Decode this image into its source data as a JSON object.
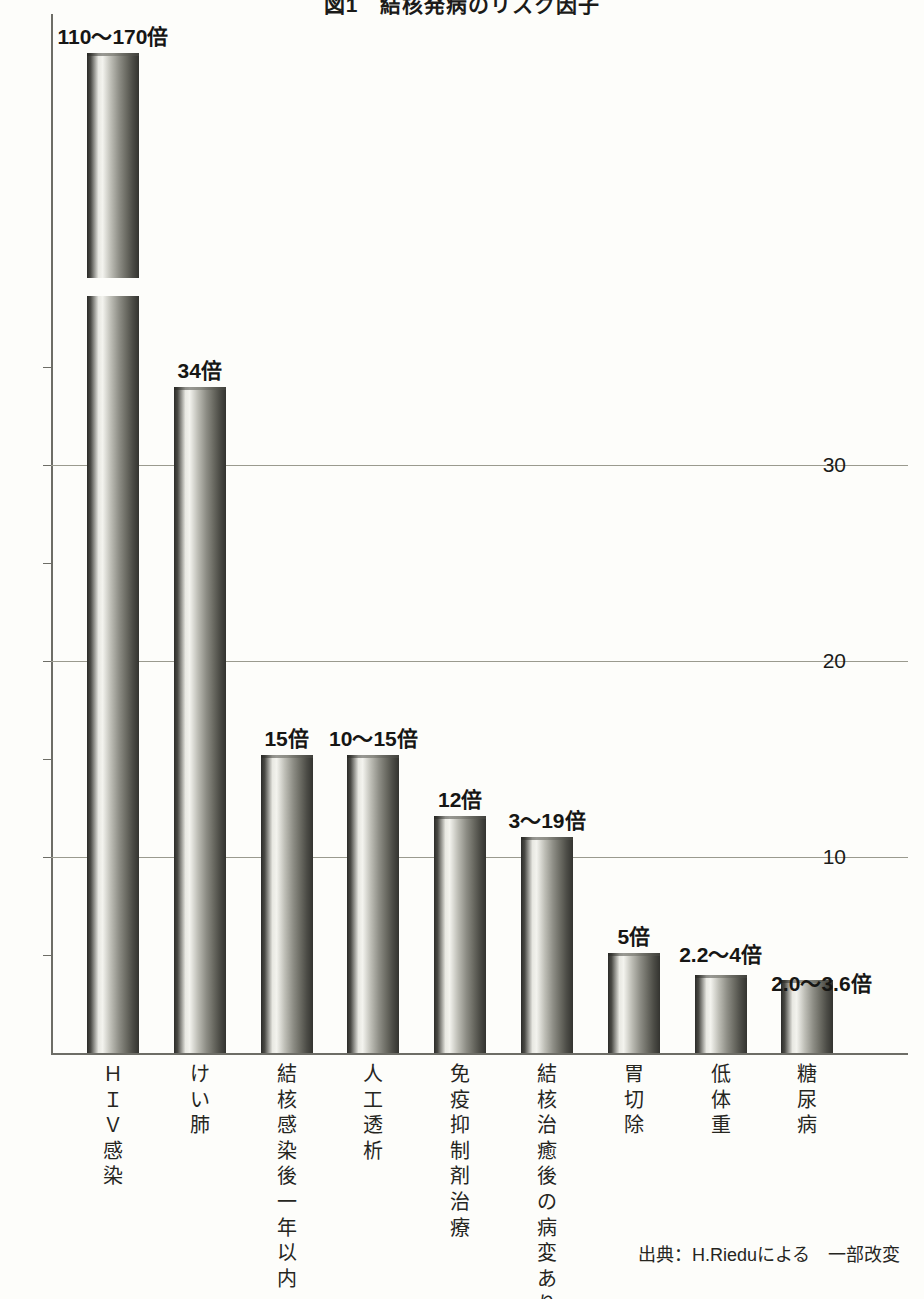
{
  "chart_data": {
    "type": "bar",
    "title": "図1　結核発病のリスク因子",
    "xlabel": "",
    "ylabel": "",
    "ylim": [
      0,
      36
    ],
    "grid": true,
    "grid_axis": "y",
    "legend": "none",
    "axis_break": {
      "series_index": 0,
      "note": "bar 1 is truncated with a wavy axis break"
    },
    "ytick_labels": [
      "10",
      "20",
      "30"
    ],
    "ytick_values": [
      10,
      20,
      30
    ],
    "categories": [
      "ＨＩＶ感染",
      "けい肺",
      "結核感染後一年以内",
      "人工透析",
      "免疫抑制剤治療",
      "結核治癒後の病変あり",
      "胃切除",
      "低体重",
      "糖尿病"
    ],
    "value_labels": [
      "110〜170倍",
      "34倍",
      "15倍",
      "10〜15倍",
      "12倍",
      "3〜19倍",
      "5倍",
      "2.2〜4倍",
      "2.0〜3.6倍"
    ],
    "values": [
      140,
      34,
      15,
      15,
      12,
      11,
      5,
      4,
      3.6
    ],
    "value_ranges": [
      [
        110,
        170
      ],
      [
        34,
        34
      ],
      [
        15,
        15
      ],
      [
        10,
        15
      ],
      [
        12,
        12
      ],
      [
        3,
        19
      ],
      [
        5,
        5
      ],
      [
        2.2,
        4
      ],
      [
        2.0,
        3.6
      ]
    ],
    "plotted_heights": [
      51.0,
      34.0,
      15.2,
      15.2,
      12.1,
      11.0,
      5.1,
      4.0,
      3.7
    ],
    "source": "出典：H.Rieduによる　一部改変"
  },
  "categories_vertical": [
    [
      "Ｈ",
      "Ｉ",
      "Ｖ",
      "感",
      "染"
    ],
    [
      "け",
      "い",
      "肺"
    ],
    [
      "結",
      "核",
      "感",
      "染",
      "後",
      "一",
      "年",
      "以",
      "内"
    ],
    [
      "人",
      "工",
      "透",
      "析"
    ],
    [
      "免",
      "疫",
      "抑",
      "制",
      "剤",
      "治",
      "療"
    ],
    [
      "結",
      "核",
      "治",
      "癒",
      "後",
      "の",
      "病",
      "変",
      "あ",
      "り"
    ],
    [
      "胃",
      "切",
      "除"
    ],
    [
      "低",
      "体",
      "重"
    ],
    [
      "糖",
      "尿",
      "病"
    ]
  ],
  "colors": {
    "background": "#fdfdfa",
    "axis": "#6d6d66",
    "gridline": "#9a9a8e",
    "text": "#1b1b19",
    "bar_dark": "#2b2b28",
    "bar_light": "#f3f3ee"
  }
}
